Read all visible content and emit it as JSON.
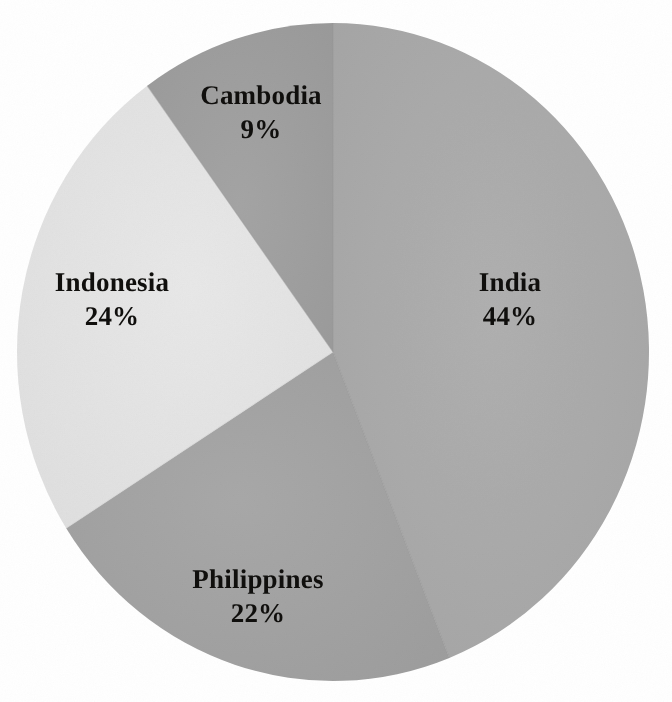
{
  "chart_data": {
    "type": "pie",
    "title": "",
    "subtitle": "",
    "xlabel": "",
    "ylabel": "",
    "legend_position": "none",
    "grid": false,
    "labels_shown": "name-and-percent",
    "categories": [
      "India",
      "Philippines",
      "Indonesia",
      "Cambodia"
    ],
    "values": [
      44,
      22,
      24,
      9
    ],
    "unit": "%",
    "total": 99,
    "start_angle_deg": 0,
    "direction": "clockwise",
    "slices": [
      {
        "name": "India",
        "value": 44,
        "value_text": "44%",
        "color": "#a9a9a9",
        "start_angle_deg": 0,
        "end_angle_deg": 158.4,
        "label_x": 510,
        "label_y": 300
      },
      {
        "name": "Philippines",
        "value": 22,
        "value_text": "22%",
        "color": "#a2a2a2",
        "start_angle_deg": 158.4,
        "end_angle_deg": 237.6,
        "label_x": 258,
        "label_y": 597
      },
      {
        "name": "Indonesia",
        "value": 24,
        "value_text": "24%",
        "color": "#e3e3e3",
        "start_angle_deg": 237.6,
        "end_angle_deg": 324.0,
        "label_x": 112,
        "label_y": 300
      },
      {
        "name": "Cambodia",
        "value": 9,
        "value_text": "9%",
        "color": "#9e9e9e",
        "start_angle_deg": 324.0,
        "end_angle_deg": 360.0,
        "label_x": 261,
        "label_y": 113
      }
    ],
    "geometry": {
      "center_x": 333,
      "center_y": 352,
      "radius_x": 316,
      "radius_y": 329
    },
    "colors": {
      "background": "#ffffff",
      "label_text": "#100f0d",
      "india": "#a9a9a9",
      "philippines": "#a2a2a2",
      "indonesia": "#e3e3e3",
      "cambodia": "#9e9e9e"
    }
  }
}
